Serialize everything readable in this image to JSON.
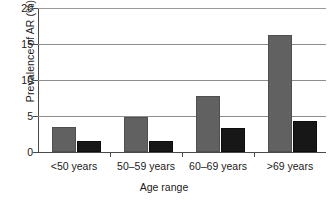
{
  "chart_data": {
    "type": "bar",
    "title": "",
    "xlabel": "Age range",
    "ylabel": "Prevalence of AR (%)",
    "categories": [
      "<50 years",
      "50–59 years",
      "60–69 years",
      ">69 years"
    ],
    "series": [
      {
        "name": "series-1",
        "color": "#616161",
        "values": [
          3.5,
          4.9,
          7.8,
          16.3
        ]
      },
      {
        "name": "series-2",
        "color": "#171717",
        "values": [
          1.5,
          1.5,
          3.3,
          4.3
        ]
      }
    ],
    "ylim": [
      0,
      20
    ],
    "yticks": [
      0,
      5,
      10,
      15,
      20
    ],
    "ytick_labels": [
      "0",
      "5",
      "10",
      "15",
      "20"
    ],
    "grid": true,
    "grid_axis": "y",
    "legend": "none",
    "legend_position": "none"
  },
  "axes": {
    "y_title": "Prevalence of AR (%)",
    "x_title": "Age range"
  }
}
